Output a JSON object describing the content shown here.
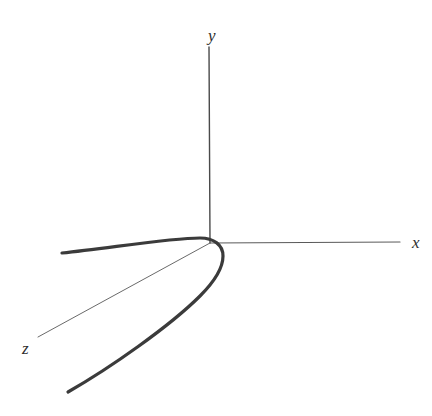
{
  "figure": {
    "kind": "3d-axes-parabola-diagram",
    "background_color": "#ffffff",
    "width": 432,
    "height": 416
  },
  "labels": {
    "y": "y",
    "x": "x",
    "z": "z"
  },
  "chart_data": {
    "type": "line",
    "title": "",
    "subtitle": "",
    "xlabel": "x",
    "ylabel": "y",
    "zlabel": "z",
    "projection": "3d-axonometric",
    "grid": false,
    "legend": false,
    "legend_position": "none",
    "origin_px": [
      210,
      243
    ],
    "axes": [
      {
        "name": "y-axis",
        "label": "y",
        "color": "#4a4a4a",
        "stroke_width": 1.4,
        "from_px": [
          209,
          47
        ],
        "to_px": [
          210,
          243
        ],
        "label_px": [
          208,
          27
        ],
        "direction": "up"
      },
      {
        "name": "x-axis",
        "label": "x",
        "color": "#5a5a5a",
        "stroke_width": 1.2,
        "from_px": [
          210,
          243
        ],
        "to_px": [
          400,
          242
        ],
        "label_px": [
          412,
          234
        ],
        "direction": "right"
      },
      {
        "name": "z-axis",
        "label": "z",
        "color": "#6a6a6a",
        "stroke_width": 1.0,
        "from_px": [
          210,
          243
        ],
        "to_px": [
          38,
          337
        ],
        "label_px": [
          22,
          340
        ],
        "direction": "down-left-toward-viewer"
      }
    ],
    "curves": [
      {
        "name": "parabola",
        "description": "thick parabolic curve opening toward upper-left and lower-left with vertex right of the origin",
        "color": "#3b3b3b",
        "stroke_width": 3.2,
        "vertex_px": [
          223,
          256
        ],
        "upper_branch_end_px": [
          62,
          253
        ],
        "lower_branch_end_px": [
          68,
          392
        ],
        "path": "M 62,253 C 110,248 170,238 200,238 C 214,238 223,245 223,256 C 223,268 214,282 200,296 C 170,326 110,368 68,392"
      }
    ],
    "annotations": [],
    "x": [],
    "values": []
  }
}
